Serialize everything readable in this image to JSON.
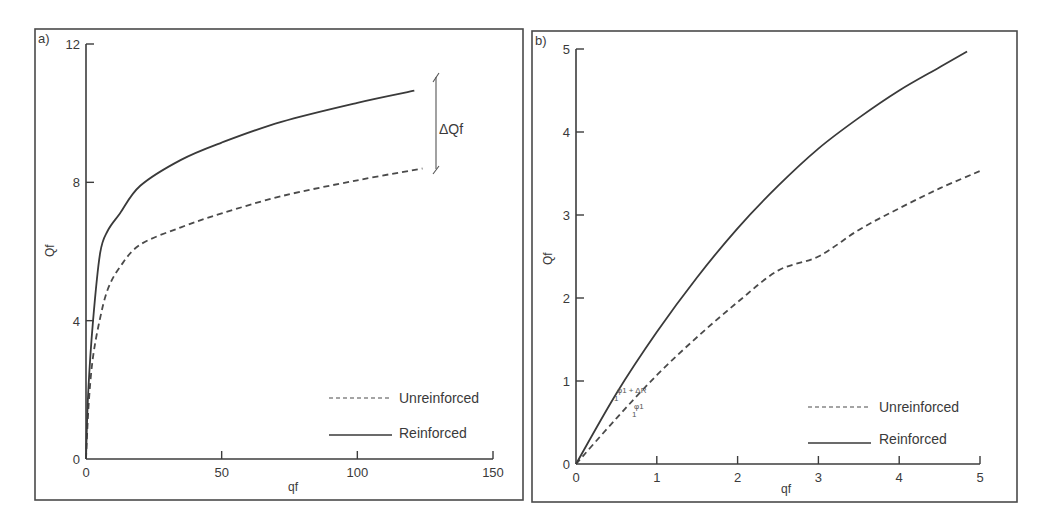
{
  "chart_data": [
    {
      "type": "line",
      "panel_label": "a)",
      "title": "",
      "xlabel": "qf",
      "ylabel": "Qf",
      "xlim": [
        0,
        150
      ],
      "ylim": [
        0,
        12
      ],
      "xticks": [
        0,
        50,
        100,
        150
      ],
      "yticks": [
        0,
        4,
        8,
        12
      ],
      "grid": false,
      "legend_position": "bottom-right",
      "series": [
        {
          "name": "Unreinforced",
          "style": "dashed",
          "x": [
            0,
            1,
            2.5,
            5,
            8,
            12.5,
            20,
            35,
            50,
            72,
            100,
            124
          ],
          "y": [
            0,
            1.6,
            2.9,
            4.0,
            4.9,
            5.55,
            6.2,
            6.7,
            7.1,
            7.6,
            8.06,
            8.4
          ]
        },
        {
          "name": "Reinforced",
          "style": "solid",
          "x": [
            0,
            0.8,
            2.6,
            5.2,
            8,
            12.5,
            20,
            35,
            50,
            72,
            100,
            121
          ],
          "y": [
            0,
            1.9,
            4.0,
            5.95,
            6.6,
            7.1,
            7.9,
            8.65,
            9.15,
            9.75,
            10.3,
            10.65
          ]
        }
      ],
      "annotations": [
        {
          "text": "ΔQf",
          "type": "bracket",
          "x": 129,
          "y_range": [
            8.4,
            11.1
          ]
        }
      ]
    },
    {
      "type": "line",
      "panel_label": "b)",
      "title": "",
      "xlabel": "qf",
      "ylabel": "Qf",
      "xlim": [
        0,
        5
      ],
      "ylim": [
        0,
        5
      ],
      "xticks": [
        0,
        1,
        2,
        3,
        4,
        5
      ],
      "yticks": [
        0,
        1,
        2,
        3,
        4,
        5
      ],
      "grid": false,
      "legend_position": "bottom-right",
      "series": [
        {
          "name": "Unreinforced",
          "style": "dashed",
          "x": [
            0,
            0.5,
            1,
            1.5,
            2,
            2.5,
            3,
            3.5,
            4,
            4.5,
            5
          ],
          "y": [
            0,
            0.55,
            1.07,
            1.53,
            1.95,
            2.33,
            2.5,
            2.82,
            3.08,
            3.32,
            3.53
          ]
        },
        {
          "name": "Reinforced",
          "style": "solid",
          "x": [
            0,
            0.5,
            1,
            1.5,
            2,
            2.5,
            3,
            3.5,
            4,
            4.5,
            4.84
          ],
          "y": [
            0,
            0.85,
            1.59,
            2.25,
            2.84,
            3.35,
            3.8,
            4.17,
            4.5,
            4.78,
            4.97
          ]
        }
      ],
      "annotations": [
        {
          "text": "φ1 + ΔR",
          "denominator": "1",
          "on_series": "Reinforced",
          "x": 0.55
        },
        {
          "text": "φ1",
          "denominator": "1",
          "on_series": "Unreinforced",
          "x": 0.75
        }
      ]
    }
  ],
  "legend": {
    "unreinforced": "Unreinforced",
    "reinforced": "Reinforced"
  },
  "annotations": {
    "delta_qf": "ΔQf",
    "slope_reinforced": "φ1 + ΔR",
    "slope_unreinforced": "φ1",
    "slope_denominator": "1"
  }
}
